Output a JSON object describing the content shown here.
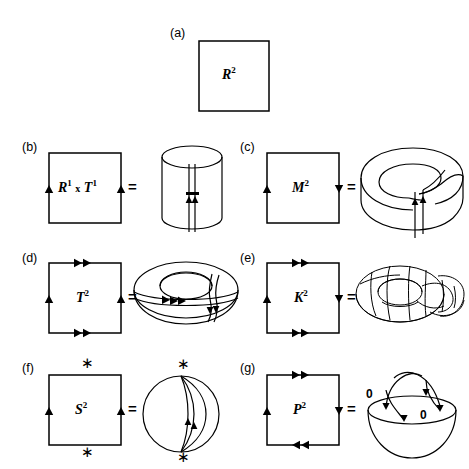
{
  "figure": {
    "background": "#ffffff",
    "ink": "#000000",
    "equals_sign": "=",
    "asterisk": "∗"
  },
  "panels": [
    {
      "key": "a",
      "label": "(a)",
      "manifold": "R",
      "exponent": "2",
      "square_label_plain": "R2",
      "has_equals": false,
      "edges": {
        "top": {
          "arrows": 0,
          "direction": "none"
        },
        "bottom": {
          "arrows": 0,
          "direction": "none"
        },
        "left": {
          "arrows": 0,
          "direction": "none"
        },
        "right": {
          "arrows": 0,
          "direction": "none"
        }
      },
      "corner_marks": "none",
      "shape": "none",
      "shape_name": "plane-no-identification"
    },
    {
      "key": "b",
      "label": "(b)",
      "manifold": "R1 x T1",
      "square_label_plain": "R1 x T1",
      "has_equals": true,
      "edges": {
        "top": {
          "arrows": 0,
          "direction": "none"
        },
        "bottom": {
          "arrows": 0,
          "direction": "none"
        },
        "left": {
          "arrows": 1,
          "direction": "up"
        },
        "right": {
          "arrows": 1,
          "direction": "up"
        }
      },
      "corner_marks": "none",
      "shape": "cylinder",
      "shape_name": "cylinder-tube"
    },
    {
      "key": "c",
      "label": "(c)",
      "manifold": "M",
      "exponent": "2",
      "square_label_plain": "M2",
      "has_equals": true,
      "edges": {
        "top": {
          "arrows": 0,
          "direction": "none"
        },
        "bottom": {
          "arrows": 0,
          "direction": "none"
        },
        "left": {
          "arrows": 1,
          "direction": "up"
        },
        "right": {
          "arrows": 1,
          "direction": "down"
        }
      },
      "corner_marks": "none",
      "shape": "mobius",
      "shape_name": "mobius-band"
    },
    {
      "key": "d",
      "label": "(d)",
      "manifold": "T",
      "exponent": "2",
      "square_label_plain": "T2",
      "has_equals": true,
      "edges": {
        "top": {
          "arrows": 2,
          "direction": "right"
        },
        "bottom": {
          "arrows": 2,
          "direction": "right"
        },
        "left": {
          "arrows": 1,
          "direction": "up"
        },
        "right": {
          "arrows": 1,
          "direction": "up"
        }
      },
      "corner_marks": "none",
      "shape": "torus",
      "shape_name": "torus-donut"
    },
    {
      "key": "e",
      "label": "(e)",
      "manifold": "K",
      "exponent": "2",
      "square_label_plain": "K2",
      "has_equals": true,
      "edges": {
        "top": {
          "arrows": 2,
          "direction": "right"
        },
        "bottom": {
          "arrows": 2,
          "direction": "right"
        },
        "left": {
          "arrows": 1,
          "direction": "up"
        },
        "right": {
          "arrows": 1,
          "direction": "down"
        }
      },
      "corner_marks": "none",
      "shape": "klein",
      "shape_name": "klein-bottle"
    },
    {
      "key": "f",
      "label": "(f)",
      "manifold": "S",
      "exponent": "2",
      "square_label_plain": "S2",
      "has_equals": true,
      "edges": {
        "top": {
          "arrows": 0,
          "direction": "none"
        },
        "bottom": {
          "arrows": 0,
          "direction": "none"
        },
        "left": {
          "arrows": 1,
          "direction": "up"
        },
        "right": {
          "arrows": 1,
          "direction": "up"
        }
      },
      "corner_marks": "asterisk-top-and-bottom",
      "shape": "sphere",
      "shape_name": "sphere",
      "shape_marks": "asterisk-top-and-bottom"
    },
    {
      "key": "g",
      "label": "(g)",
      "manifold": "P",
      "exponent": "2",
      "square_label_plain": "P2",
      "has_equals": true,
      "edges": {
        "top": {
          "arrows": 2,
          "direction": "right"
        },
        "bottom": {
          "arrows": 2,
          "direction": "left"
        },
        "left": {
          "arrows": 1,
          "direction": "up"
        },
        "right": {
          "arrows": 1,
          "direction": "down"
        }
      },
      "corner_marks": "none",
      "shape": "hemisphere",
      "shape_name": "hemisphere-with-antipodal-identification",
      "annotations": [
        {
          "text": "0",
          "role": "antipodal-point-left"
        },
        {
          "text": "0",
          "role": "antipodal-point-right"
        }
      ]
    }
  ]
}
